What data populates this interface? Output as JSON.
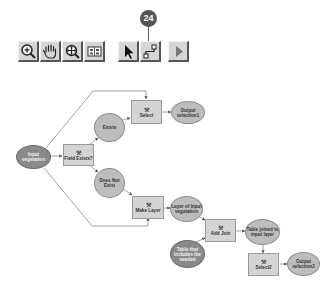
{
  "callout": {
    "label": "24"
  },
  "toolbar": {
    "buttons": [
      {
        "name": "zoom-in-icon",
        "label": "Zoom In"
      },
      {
        "name": "pan-icon",
        "label": "Pan"
      },
      {
        "name": "full-extent-icon",
        "label": "Full Extent"
      },
      {
        "name": "auto-layout-icon",
        "label": "Auto Layout"
      },
      {
        "name": "select-arrow-icon",
        "label": "Select Elements"
      },
      {
        "name": "connect-icon",
        "label": "Add Connection"
      },
      {
        "name": "run-icon",
        "label": "Run"
      }
    ]
  },
  "diagram": {
    "colors": {
      "tool_fill": "#d4d4d4",
      "derived_data_fill": "#bdbdbd",
      "input_data_fill": "#8a8a8a",
      "connector": "#7a7a7a"
    },
    "nodes": {
      "input_vegetation": "Input vegetation",
      "field_exists": "Field Exists?",
      "exists": "Exists",
      "does_not_exist": "Does Not Exist",
      "select": "Select",
      "output_selection1": "Output selection1",
      "make_layer": "Make Layer",
      "layer_of_input_vegetation": "Layer of Input vegetation",
      "add_join": "Add Join",
      "table_that_includes": "Table that includes the needed",
      "table_joined": "Table joined to input layer",
      "select2": "Select2",
      "output_selection2": "Output selection2"
    },
    "tool_icon": "hammer-icon"
  }
}
